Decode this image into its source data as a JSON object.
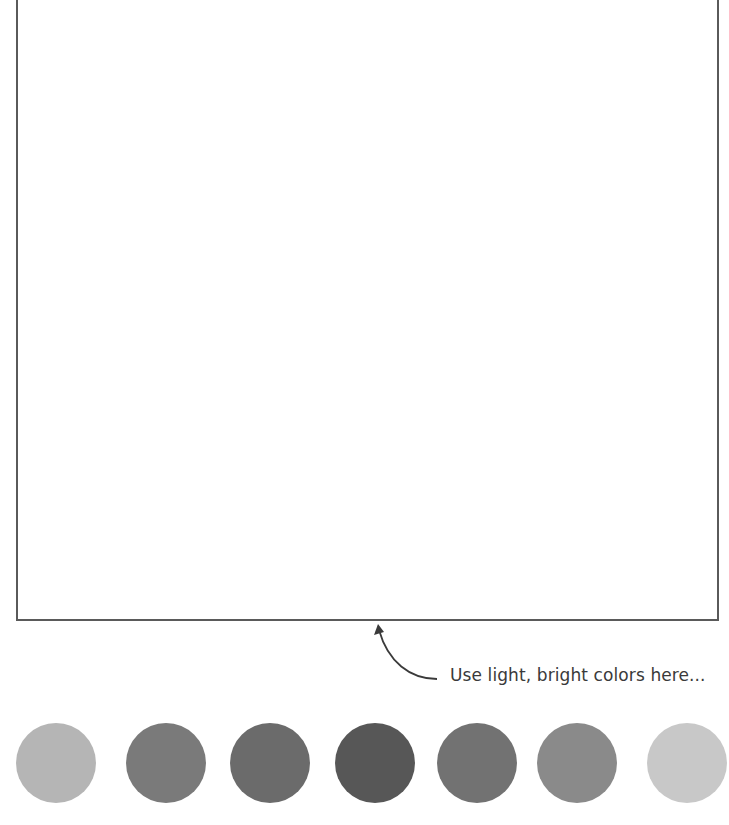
{
  "canvas": {
    "label": "drawing-area",
    "border_color": "#5a5a5a"
  },
  "hint": {
    "text": "Use light, bright colors here..."
  },
  "palette": {
    "swatches": [
      {
        "name": "swatch-1",
        "color": "#b5b5b5",
        "left": 16
      },
      {
        "name": "swatch-2",
        "color": "#7a7a7a",
        "left": 126
      },
      {
        "name": "swatch-3",
        "color": "#6b6b6b",
        "left": 230
      },
      {
        "name": "swatch-4",
        "color": "#575757",
        "left": 335
      },
      {
        "name": "swatch-5",
        "color": "#727272",
        "left": 437
      },
      {
        "name": "swatch-6",
        "color": "#8a8a8a",
        "left": 537
      },
      {
        "name": "swatch-7",
        "color": "#c8c8c8",
        "left": 647
      }
    ]
  }
}
